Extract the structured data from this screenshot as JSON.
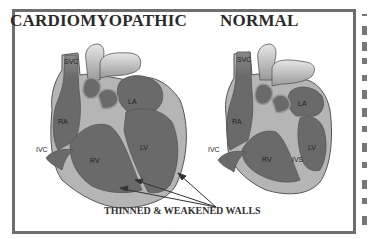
{
  "diagram": {
    "panels": [
      {
        "title": "CARDIOMYOPATHIC",
        "labels": {
          "svc": "SVC",
          "ra": "RA",
          "la": "LA",
          "ivc": "IVC",
          "rv": "RV",
          "lv": "LV"
        }
      },
      {
        "title": "NORMAL",
        "labels": {
          "svc": "SVC",
          "ra": "RA",
          "la": "LA",
          "ivc": "IVC",
          "rv": "RV",
          "ivs": "IVS",
          "lv": "LV"
        }
      }
    ],
    "caption": "THINNED & WEAKENED WALLS",
    "colors": {
      "border": "#6e6e6e",
      "chamber": "#6a6a6a",
      "wall": "#b5b5b5",
      "vessel_light": "#cfcfcf",
      "text": "#2a2a2a"
    }
  }
}
